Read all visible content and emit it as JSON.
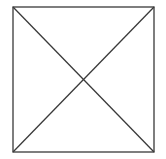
{
  "diagram": {
    "type": "square-with-diagonals",
    "stroke_color": "#3a3a3a",
    "background_color": "#ffffff",
    "stroke_width": 1.3,
    "square": {
      "x1": 13,
      "y1": 7,
      "x2": 154,
      "y2": 152
    },
    "shapes": [
      {
        "kind": "rect",
        "name": "outer-square"
      },
      {
        "kind": "line",
        "name": "diagonal-top-left-to-bottom-right",
        "from": "top-left",
        "to": "bottom-right"
      },
      {
        "kind": "line",
        "name": "diagonal-top-right-to-bottom-left",
        "from": "top-right",
        "to": "bottom-left"
      }
    ]
  }
}
